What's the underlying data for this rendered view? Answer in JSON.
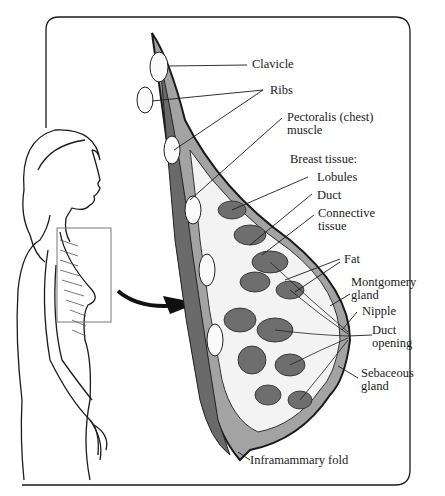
{
  "diagram": {
    "labels": {
      "clavicle": "Clavicle",
      "ribs": "Ribs",
      "pectoralis_1": "Pectoralis (chest)",
      "pectoralis_2": "muscle",
      "breast_tissue": "Breast tissue:",
      "lobules": "Lobules",
      "duct": "Duct",
      "connective_1": "Connective",
      "connective_2": "tissue",
      "fat": "Fat",
      "montgomery_1": "Montgomery",
      "montgomery_2": "gland",
      "nipple": "Nipple",
      "duct_opening_1": "Duct",
      "duct_opening_2": "opening",
      "sebaceous_1": "Sebaceous",
      "sebaceous_2": "gland",
      "inframammary": "Inframammary fold"
    },
    "colors": {
      "line": "#1a1a1a",
      "tissue_fill": "#9a9a9a",
      "lobule_fill": "#6e6e6e",
      "background": "#ffffff"
    }
  }
}
